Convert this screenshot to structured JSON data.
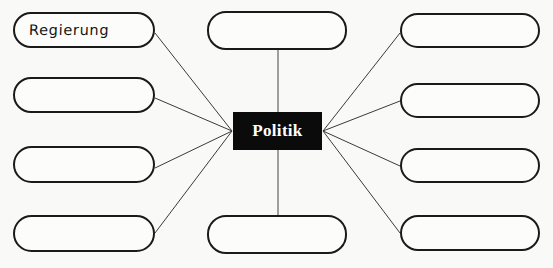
{
  "diagram": {
    "type": "mind-map",
    "title_node": "Politik",
    "background_color": "#f9f9f8",
    "center": {
      "label": "Politik",
      "fill_color": "#0b0b0b",
      "text_color": "#ffffff",
      "x": 233,
      "y": 112,
      "width": 89,
      "height": 38
    },
    "nodes": [
      {
        "id": "left-1",
        "label": "Regierung",
        "filled": true,
        "x": 13,
        "y": 12,
        "width": 142,
        "height": 36
      },
      {
        "id": "left-2",
        "label": "",
        "filled": false,
        "x": 13,
        "y": 77,
        "width": 142,
        "height": 36
      },
      {
        "id": "left-3",
        "label": "",
        "filled": false,
        "x": 13,
        "y": 146,
        "width": 142,
        "height": 37
      },
      {
        "id": "left-4",
        "label": "",
        "filled": false,
        "x": 13,
        "y": 215,
        "width": 142,
        "height": 37
      },
      {
        "id": "top",
        "label": "",
        "filled": false,
        "x": 207,
        "y": 11,
        "width": 140,
        "height": 39
      },
      {
        "id": "bottom",
        "label": "",
        "filled": false,
        "x": 207,
        "y": 215,
        "width": 140,
        "height": 39
      },
      {
        "id": "right-1",
        "label": "",
        "filled": false,
        "x": 400,
        "y": 13,
        "width": 140,
        "height": 35
      },
      {
        "id": "right-2",
        "label": "",
        "filled": false,
        "x": 400,
        "y": 83,
        "width": 140,
        "height": 35
      },
      {
        "id": "right-3",
        "label": "",
        "filled": false,
        "x": 400,
        "y": 148,
        "width": 140,
        "height": 35
      },
      {
        "id": "right-4",
        "label": "",
        "filled": false,
        "x": 400,
        "y": 215,
        "width": 140,
        "height": 36
      }
    ],
    "edges": [
      {
        "from": "left-1",
        "to": "center",
        "x1": 155,
        "y1": 33,
        "x2": 232,
        "y2": 131,
        "color": "#3a3a3a",
        "width": 1.0
      },
      {
        "from": "left-2",
        "to": "center",
        "x1": 155,
        "y1": 98,
        "x2": 232,
        "y2": 131,
        "color": "#3a3a3a",
        "width": 1.0
      },
      {
        "from": "left-3",
        "to": "center",
        "x1": 155,
        "y1": 168,
        "x2": 232,
        "y2": 131,
        "color": "#3a3a3a",
        "width": 1.0
      },
      {
        "from": "left-4",
        "to": "center",
        "x1": 155,
        "y1": 233,
        "x2": 232,
        "y2": 131,
        "color": "#3a3a3a",
        "width": 1.0
      },
      {
        "from": "top",
        "to": "center",
        "x1": 278,
        "y1": 50,
        "x2": 278,
        "y2": 112,
        "color": "#6e6e6e",
        "width": 1.3
      },
      {
        "from": "bottom",
        "to": "center",
        "x1": 278,
        "y1": 150,
        "x2": 278,
        "y2": 215,
        "color": "#6e6e6e",
        "width": 1.3
      },
      {
        "from": "right-1",
        "to": "center",
        "x1": 400,
        "y1": 33,
        "x2": 323,
        "y2": 131,
        "color": "#3a3a3a",
        "width": 1.0
      },
      {
        "from": "right-2",
        "to": "center",
        "x1": 400,
        "y1": 101,
        "x2": 323,
        "y2": 131,
        "color": "#3a3a3a",
        "width": 1.0
      },
      {
        "from": "right-3",
        "to": "center",
        "x1": 400,
        "y1": 166,
        "x2": 323,
        "y2": 131,
        "color": "#3a3a3a",
        "width": 1.0
      },
      {
        "from": "right-4",
        "to": "center",
        "x1": 400,
        "y1": 233,
        "x2": 323,
        "y2": 131,
        "color": "#3a3a3a",
        "width": 1.0
      }
    ]
  }
}
